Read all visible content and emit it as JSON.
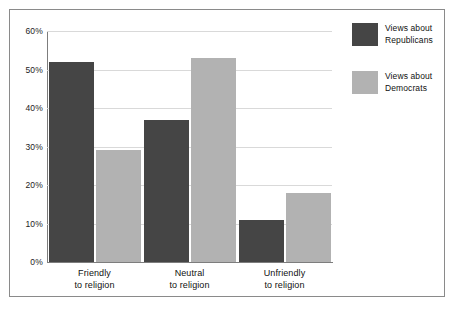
{
  "chart_data": {
    "type": "bar",
    "title": "",
    "subtitle": "",
    "xlabel": "",
    "ylabel": "",
    "categories": [
      "Friendly to religion",
      "Neutral to religion",
      "Unfriendly to religion"
    ],
    "category_lines": [
      {
        "line1": "Friendly",
        "line2": "to religion"
      },
      {
        "line1": "Neutral",
        "line2": "to religion"
      },
      {
        "line1": "Unfriendly",
        "line2": "to religion"
      }
    ],
    "series": [
      {
        "name": "Views about Republicans",
        "name_lines": {
          "line1": "Views about",
          "line2": "Republicans"
        },
        "color": "#454545",
        "values": [
          52,
          37,
          11
        ]
      },
      {
        "name": "Views about Democrats",
        "name_lines": {
          "line1": "Views about",
          "line2": "Democrats"
        },
        "color": "#b2b2b2",
        "values": [
          29,
          53,
          18
        ]
      }
    ],
    "ylim": [
      0,
      60
    ],
    "ytick_values": [
      0,
      10,
      20,
      30,
      40,
      50,
      60
    ],
    "ytick_labels": [
      "0%",
      "10%",
      "20%",
      "30%",
      "40%",
      "50%",
      "60%"
    ],
    "grid": true,
    "grid_color": "#d9d9d9",
    "legend_position": "right",
    "value_suffix": "%"
  }
}
